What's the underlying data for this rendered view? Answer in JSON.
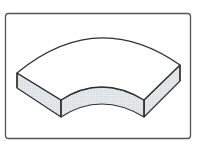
{
  "figure": {
    "colors": {
      "background": "#ffffff",
      "frame_stroke": "#555555",
      "outline": "#2e2e2e",
      "top_face": "#ffffff",
      "side_face": "#e3e7e9"
    },
    "frame": {
      "x": 5,
      "y": 13,
      "width": 186,
      "height": 126,
      "radius": 3
    },
    "shape": {
      "type": "curved-slab",
      "outer_arc": {
        "start": [
          17,
          73
        ],
        "control": [
          97,
          7
        ],
        "end": [
          180,
          65
        ]
      },
      "inner_arc_top": {
        "start": [
          61,
          100
        ],
        "control": [
          101,
          74
        ],
        "end": [
          144,
          100
        ]
      },
      "inner_arc_bottom": {
        "start": [
          61,
          117
        ],
        "control": [
          101,
          91
        ],
        "end": [
          144,
          117
        ]
      },
      "left_end": {
        "top_back": [
          17,
          73
        ],
        "bottom_back": [
          17,
          88
        ],
        "top_front": [
          61,
          100
        ],
        "bottom_front": [
          61,
          117
        ]
      },
      "right_end": {
        "top_back": [
          180,
          65
        ],
        "bottom_back": [
          180,
          81
        ],
        "top_front": [
          144,
          100
        ],
        "bottom_front": [
          144,
          117
        ]
      }
    }
  }
}
